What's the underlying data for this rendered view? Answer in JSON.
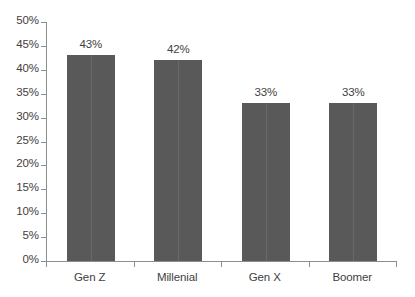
{
  "chart_data": {
    "type": "bar",
    "title": "",
    "subtitle": "",
    "xlabel": "",
    "ylabel": "",
    "categories": [
      "Gen Z",
      "Millenial",
      "Gen X",
      "Boomer"
    ],
    "values": [
      43,
      42,
      33,
      33
    ],
    "value_labels": [
      "43%",
      "42%",
      "33%",
      "33%"
    ],
    "ylim": [
      0,
      50
    ],
    "ytick_step": 5,
    "ytick_labels": [
      "0%",
      "5%",
      "10%",
      "15%",
      "20%",
      "25%",
      "30%",
      "35%",
      "40%",
      "45%",
      "50%"
    ],
    "ytick_values": [
      0,
      5,
      10,
      15,
      20,
      25,
      30,
      35,
      40,
      45,
      50
    ],
    "grid": false,
    "legend": false,
    "legend_position": "none",
    "orientation": "vertical"
  },
  "style": {
    "bar_color": "#595959",
    "text_color": "#414141",
    "axis_color": "#8d8d8d",
    "background_color": "#ffffff"
  }
}
